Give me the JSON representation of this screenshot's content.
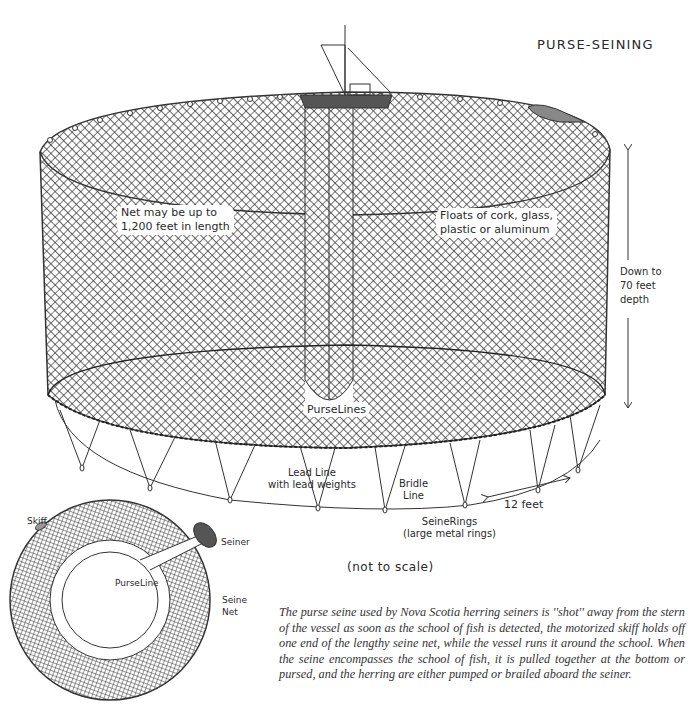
{
  "diagram": {
    "title": "PURSE-SEINING",
    "main_illustration": {
      "labels": {
        "net_length": [
          "Net may be up to",
          "1,200 feet in length"
        ],
        "floats": [
          "Floats of cork, glass,",
          "plastic or aluminum"
        ],
        "depth": [
          "Down to",
          "70 feet",
          "depth"
        ],
        "purse_lines": "PurseLines",
        "lead_line": [
          "Lead Line",
          "with lead weights"
        ],
        "bridle_line": [
          "Bridle",
          "Line"
        ],
        "ring_spacing": "12 feet",
        "seine_rings": [
          "SeineRings",
          "(large metal rings)"
        ]
      },
      "note": "(not to scale)"
    },
    "top_view_inset": {
      "labels": {
        "skiff": "Skiff",
        "seiner": "Seiner",
        "purse_line": "PurseLine",
        "seine_net": [
          "Seine",
          "Net"
        ]
      }
    },
    "caption": "The purse seine used by Nova Scotia herring seiners is ''shot'' away from the stern of the vessel as soon as the school of fish is detected, the motorized skiff holds off one end of the lengthy seine net, while the vessel runs it around the school. When the seine encompasses the school of fish, it is pulled together at the bottom or pursed, and the herring are either pumped or brailed aboard the seiner."
  },
  "colors": {
    "ink": "#2a2a2a",
    "background": "#ffffff"
  }
}
